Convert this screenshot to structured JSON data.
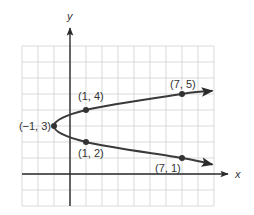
{
  "chart_data": {
    "type": "line",
    "title": "",
    "xlabel": "x",
    "ylabel": "y",
    "xlim": [
      -3,
      9
    ],
    "ylim": [
      -2,
      8
    ],
    "grid": true,
    "series": [
      {
        "name": "sideways parabola",
        "equation_shape": "x = (y - 3)^2 - 1",
        "points": [
          {
            "x": 7,
            "y": 5,
            "label": "(7, 5)"
          },
          {
            "x": 1,
            "y": 4,
            "label": "(1, 4)"
          },
          {
            "x": -1,
            "y": 3,
            "label": "(−1, 3)"
          },
          {
            "x": 1,
            "y": 2,
            "label": "(1, 2)"
          },
          {
            "x": 7,
            "y": 1,
            "label": "(7, 1)"
          }
        ],
        "arrow_ends": [
          {
            "x": 8.9,
            "y": 5.2
          },
          {
            "x": 8.9,
            "y": 0.6
          }
        ]
      }
    ]
  }
}
